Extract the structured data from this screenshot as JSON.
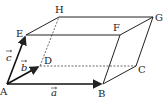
{
  "diagram": {
    "vertices": {
      "A": {
        "label": "A",
        "x": 7,
        "y": 84
      },
      "B": {
        "label": "B",
        "x": 103,
        "y": 84
      },
      "C": {
        "label": "C",
        "x": 136,
        "y": 66
      },
      "D": {
        "label": "D",
        "x": 40,
        "y": 66
      },
      "E": {
        "label": "E",
        "x": 26,
        "y": 35
      },
      "F": {
        "label": "F",
        "x": 120,
        "y": 35
      },
      "G": {
        "label": "G",
        "x": 153,
        "y": 17
      },
      "H": {
        "label": "H",
        "x": 59,
        "y": 17
      }
    },
    "vectors": {
      "a": {
        "label": "a",
        "from": "A",
        "to": "B"
      },
      "b": {
        "label": "b",
        "from": "A",
        "to": "D"
      },
      "c": {
        "label": "c",
        "from": "A",
        "to": "E"
      }
    },
    "hidden_edges": [
      "AD-dashed",
      "DC",
      "DH"
    ],
    "colors": {
      "stroke": "#222222",
      "background": "#ffffff"
    }
  }
}
